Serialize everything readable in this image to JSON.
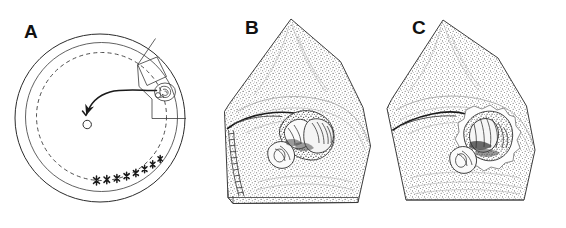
{
  "figure": {
    "type": "scientific-illustration",
    "background_color": "#ffffff",
    "ink_color": "#2b2b2b",
    "width": 566,
    "height": 228,
    "panel_count": 3
  },
  "panels": [
    {
      "id": "a",
      "label": "A",
      "description": "schematic circular diagram with concentric outer circle, inner circle and dashed circle, a radial sector outlined at upper right, a curved arrow trajectory ending in a small open circle, a small drawn organism inside a circle, and a row of small cross marks along the lower right arc of the dashed circle",
      "elements": {
        "outer_circle": "outer-circle",
        "inner_circle": "inner-circle",
        "dashed_circle": "dashed-circle",
        "sector": "radial-sector",
        "diamond": "rotated-quadrilateral",
        "arrow": "curved-arrow-trajectory",
        "arrow_tail_marker": "small-open-circle",
        "organism": "organism-in-circle",
        "cross_marks_count": 8
      }
    },
    {
      "id": "b",
      "label": "B",
      "description": "stippled wedge-shaped tissue section with apex at top and curved right edge, a dark incision line running from the left edge to a central dissected structure, a fringed hatched arc along the lower left margin, and a thin three-dimensional edge along the bottom",
      "elements": {
        "wedge": "stippled-tissue-wedge",
        "incision_line": "incision-line",
        "specimen": "dissected-structure",
        "fringe": "fringed-margin",
        "base_edge": "three-dimensional-base-edge"
      }
    },
    {
      "id": "c",
      "label": "C",
      "description": "stippled wedge-shaped tissue section with apex at top and curved right edge, straight bottom edge, a dark incision line from the left margin to a central dissected structure that is encircled by a pale irregular halo",
      "elements": {
        "wedge": "stippled-tissue-wedge",
        "incision_line": "incision-line",
        "specimen": "dissected-structure",
        "halo": "pale-irregular-halo",
        "base_edge": "straight-base-edge"
      }
    }
  ]
}
